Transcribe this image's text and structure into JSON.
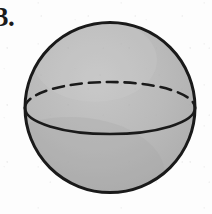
{
  "figure": {
    "label": "3.",
    "kind": "sphere-diagram",
    "background_color": "#fdfdfd",
    "sphere": {
      "fill_color": "#b5b5b5",
      "fill_color_light": "#c4c4c4",
      "fill_color_dark": "#a8a8a8",
      "outline_color": "#1a1a1a",
      "outline_width": 3,
      "center_x": 110,
      "center_y": 107.5,
      "radius_x": 85,
      "radius_y": 85.5
    },
    "equator": {
      "semi_minor_axis": 26,
      "front_arc_style": "solid",
      "back_arc_style": "dashed",
      "dash_pattern": "11 7",
      "line_color": "#1a1a1a",
      "line_width": 2.4,
      "left_endpoint_x": 25,
      "left_endpoint_y": 108,
      "right_endpoint_x": 195,
      "right_endpoint_y": 108
    }
  }
}
